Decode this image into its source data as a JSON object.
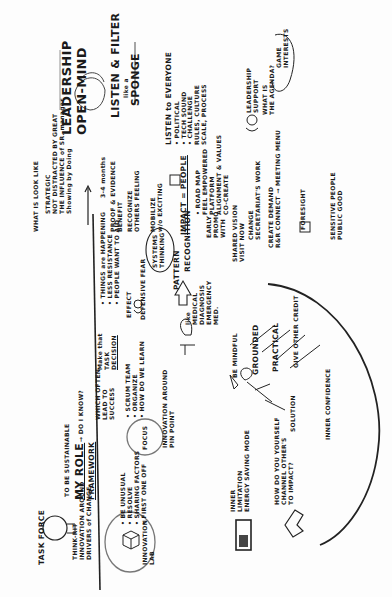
{
  "sketchnote": {
    "orientation": "rotated 90deg counter-clockwise",
    "headline": {
      "title_line1": "LEADERSHIP",
      "title_line2": "OPEN-MIND",
      "subtitle_line1": "LISTEN & FILTER",
      "subtitle_line2": "like a",
      "subtitle_line3": "SPONGE"
    },
    "listen_section": {
      "heading": "LISTEN to EVERYONE",
      "items": [
        "• POLITICAL",
        "• TECH SOUND",
        "• CHALLENGE",
        "RULES, CULTURE",
        "SCALE, PROCESS"
      ]
    },
    "leadership_support": {
      "label_line1": "LEADERSHIP",
      "label_line2": "SUPPORT",
      "question_line1": "WHAT IS",
      "question_line2": "THE AGENDA?",
      "callout_line1": "GAME",
      "callout_line2": "INTERESTS"
    },
    "strategic": {
      "label": "WHAT IS LOOK LIKE",
      "lines": [
        "STRATEGIC",
        "NOT DISTRACTED BY GREAT",
        "THE INFLUENCE of SR. manager",
        "Showing by Doing"
      ]
    },
    "timeline": {
      "duration": "3-4 months",
      "steps": [
        {
          "num": "1",
          "text": "PROOF & EVIDENCE",
          "sub": "BENEFIT"
        },
        {
          "num": "2",
          "text": "RECOGNIZE",
          "sub": "OTHERS FEELING"
        },
        {
          "num": "3",
          "text": "MOBILIZE",
          "sub": "w/o EXCITING"
        },
        {
          "num": "4",
          "text": "CHANGE",
          "sub": "SECRETARIAT'S WORK"
        },
        {
          "num": "5",
          "text": "CREATE DEMAND",
          "sub": "R&R CONNECT → MEETING MENU"
        },
        {
          "num": "6",
          "text": "FORESIGHT",
          "sub": ""
        },
        {
          "num": "7",
          "text": "SENSITIVE PEOPLE",
          "sub": "PUBLIC GOOD"
        }
      ]
    },
    "impact": {
      "heading": "IMPACT = PEOPLE",
      "items": [
        "• ROAD MAP",
        "FEEL EMPOWERED",
        "PLATFORM",
        "ALIGNMENT & VALUES",
        "CO-CREATE"
      ],
      "side": [
        "EARLY",
        "PROMO",
        "WITH"
      ],
      "side2": [
        "SHARED VISION",
        "VISIT NOW"
      ]
    },
    "systems": {
      "circle_line1": "SYSTEMS",
      "circle_line2": "THINKING",
      "pattern": "PATTERN",
      "recognition": "RECOGNITION"
    },
    "things_happening": {
      "lines": [
        "• THINGS are HAPPENING",
        "• LESS RESISTANCE",
        "• PEOPLE WANT TO AID"
      ],
      "fear_label": "DEFENSIVE FEAR",
      "effect": "EFFECT"
    },
    "medical": {
      "lines": [
        "like",
        "MEDICAL",
        "DIAGNOSIS",
        "EMERGENCY",
        "MED."
      ]
    },
    "my_role": {
      "intro": "TO BE SUSTAINABLE",
      "title": "MY ROLE",
      "framework": "FRAMEWORK",
      "question": "→ DO I KNOW?",
      "success_line1": "WHICH OFTEN",
      "success_line2": "LEAD TO",
      "success_line3": "SUCCESS",
      "decision_line1": "Make that",
      "decision_line2": "TASK",
      "decision_line3": "DECISION"
    },
    "focus": {
      "label": "FOCUS",
      "items": [
        "• SCRUM TEAM",
        "• ORGANIZE",
        "• HOW DO WE LEARN",
        "INNOVATION AROUND",
        "PIN POINT"
      ]
    },
    "task_force": {
      "label": "TASK FORCE",
      "lines": [
        "THINK-RIT",
        "INNOVATION AROUND",
        "DRIVERS of CHANGE"
      ]
    },
    "innovation_lab": {
      "label_line1": "INNOVATION",
      "label_line2": "LAB",
      "items": [
        "• BE UNUSUAL",
        "• RESOLVE",
        "• SHARING FACTORS",
        "• FIRST ONE OFF"
      ]
    },
    "mindful": {
      "lines": [
        "BE MINDFUL",
        "GROUNDED",
        "PRACTICAL",
        "GIVE OTHER CREDIT"
      ],
      "left": [
        "SOLUTION",
        "INNER CONFIDENCE"
      ]
    },
    "energy": {
      "lines": [
        "INNER",
        "LIMITATION",
        "ENERGY SAVING MODE"
      ],
      "question_line1": "HOW DO YOU YOURSELF",
      "question_line2": "CHANNEL OTHER'S",
      "question_line3": "TO IMPACT?"
    }
  }
}
